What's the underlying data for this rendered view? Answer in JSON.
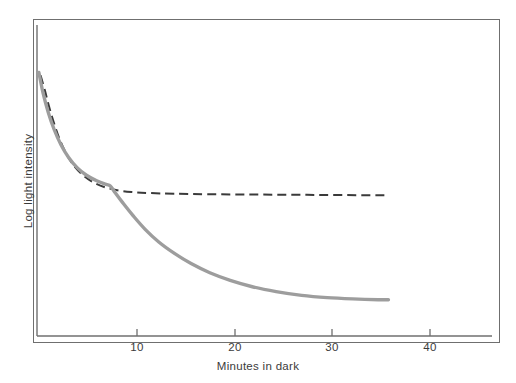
{
  "figure": {
    "frame": {
      "x": 33,
      "y": 19,
      "width": 467,
      "height": 324
    },
    "background_color": "#ffffff",
    "frame_color": "#6f6f6f"
  },
  "axes": {
    "x": {
      "label": "Minutes in dark",
      "ticks": [
        "10",
        "20",
        "30",
        "40"
      ],
      "tick_values": [
        10,
        20,
        30,
        40
      ],
      "axis_line_color": "#6f6f6f",
      "pixel_origin_x": 37,
      "pixel_per_unit": 9.77
    },
    "y": {
      "label": "Log light intensity",
      "ticks": [],
      "axis_line_color": "#6f6f6f"
    }
  },
  "chart_data": {
    "type": "line",
    "title": "",
    "xlabel": "Minutes in dark",
    "ylabel": "Log light intensity",
    "xlim": [
      0,
      47.5
    ],
    "ylim": [
      0,
      1
    ],
    "grid": false,
    "legend": "none",
    "annotations": [
      "Rod-cone break (kink) occurs near 8.5 minutes on the solid curve"
    ],
    "series": [
      {
        "name": "Cone adaptation only (dashed)",
        "style": "dashed",
        "color": "#3a3a3a",
        "width": 2.0,
        "x": [
          0.3,
          0.8,
          1.3,
          1.9,
          2.6,
          3.4,
          4.3,
          5.4,
          6.6,
          8.0,
          9.5,
          11.0,
          13.0,
          16.0,
          20.0,
          25.0,
          30.0,
          35.0,
          41.3
        ],
        "y": [
          0.963,
          0.905,
          0.84,
          0.773,
          0.707,
          0.65,
          0.604,
          0.567,
          0.54,
          0.521,
          0.51,
          0.504,
          0.5,
          0.497,
          0.495,
          0.494,
          0.493,
          0.492,
          0.491
        ]
      },
      {
        "name": "Full dark adaptation (solid, rod + cone)",
        "style": "solid",
        "color": "#9d9d9d",
        "width": 3.4,
        "x": [
          0.1,
          0.6,
          1.2,
          1.9,
          2.7,
          3.6,
          4.6,
          5.7,
          6.9,
          8.0,
          8.5,
          9.1,
          10.0,
          11.2,
          12.6,
          14.2,
          16.0,
          18.0,
          20.2,
          22.6,
          25.2,
          28.0,
          31.0,
          34.0,
          37.0,
          40.0,
          41.2
        ],
        "y": [
          0.975,
          0.893,
          0.818,
          0.75,
          0.69,
          0.64,
          0.6,
          0.57,
          0.548,
          0.534,
          0.528,
          0.5,
          0.46,
          0.41,
          0.357,
          0.307,
          0.263,
          0.222,
          0.186,
          0.156,
          0.131,
          0.112,
          0.097,
          0.088,
          0.083,
          0.08,
          0.08
        ]
      }
    ]
  }
}
